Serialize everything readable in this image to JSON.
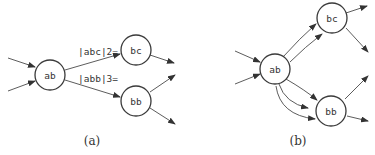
{
  "panels": [
    {
      "caption": "(a)",
      "nodes": [
        {
          "id": "ab",
          "label": "ab"
        },
        {
          "id": "bc",
          "label": "bc"
        },
        {
          "id": "bb",
          "label": "bb"
        }
      ],
      "edge_labels": [
        {
          "from": "ab",
          "to": "bc",
          "label": "|abc|2="
        },
        {
          "from": "ab",
          "to": "bb",
          "label": "|abb|3="
        }
      ]
    },
    {
      "caption": "(b)",
      "nodes": [
        {
          "id": "ab",
          "label": "ab"
        },
        {
          "id": "bc",
          "label": "bc"
        },
        {
          "id": "bb",
          "label": "bb"
        }
      ]
    }
  ]
}
